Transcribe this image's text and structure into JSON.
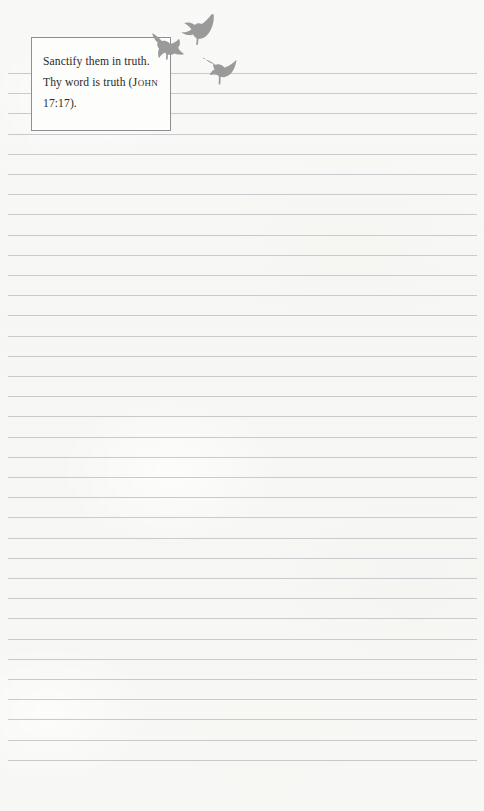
{
  "page": {
    "width": 484,
    "height": 811,
    "paper_color": "#f7f7f5",
    "rule_color": "#c9c9ce",
    "kind": "lined-notebook-page"
  },
  "rules": {
    "count": 35,
    "first_y": 73,
    "spacing": 20.2,
    "left_x": 8,
    "right_x": 477
  },
  "quote": {
    "line1": "Sanctify them in",
    "line2": "truth. Thy word is",
    "line3_prefix": "truth (",
    "reference": "John",
    "line3_suffix": " 17:17).",
    "full_text": "Sanctify them in truth. Thy word is truth (JOHN 17:17).",
    "border_color": "#8f8f93",
    "background_color": "#fdfdfc",
    "text_color": "#2b2b2b"
  },
  "birds": {
    "color": "#9a9a9a",
    "items": [
      {
        "name": "bird-upper-right",
        "x": 181,
        "y": 13,
        "width": 38,
        "height": 32
      },
      {
        "name": "bird-left-of-box",
        "x": 150,
        "y": 31,
        "width": 34,
        "height": 30
      },
      {
        "name": "bird-lower",
        "x": 202,
        "y": 52,
        "width": 38,
        "height": 34
      }
    ]
  }
}
